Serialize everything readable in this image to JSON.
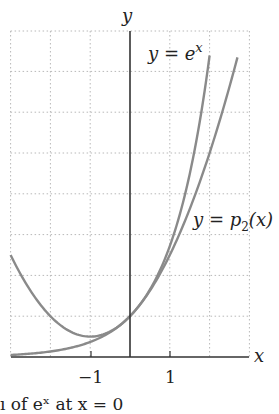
{
  "chart_data": {
    "type": "line",
    "title": "",
    "xlabel": "x",
    "ylabel": "y",
    "xlim": [
      -3,
      3
    ],
    "ylim": [
      0,
      8
    ],
    "grid": true,
    "x_ticks": [
      -1,
      1
    ],
    "x_tick_labels": [
      "−1",
      "1"
    ],
    "series": [
      {
        "name": "y = e^x",
        "label_parts": {
          "base": "y = e",
          "sup": "x"
        },
        "function": "exp(x)",
        "domain": [
          -3,
          2.0
        ],
        "x": [
          -3,
          -2,
          -1,
          0,
          1,
          1.5,
          2.0
        ],
        "values": [
          0.05,
          0.14,
          0.37,
          1.0,
          2.72,
          4.48,
          7.39
        ]
      },
      {
        "name": "y = p2(x)",
        "label_parts": {
          "base": "y = p",
          "sub": "2",
          "tail": "(x)"
        },
        "function": "1 + x + x^2/2",
        "domain": [
          -3,
          2.7
        ],
        "x": [
          -3,
          -2,
          -1,
          0,
          1,
          2,
          2.7
        ],
        "values": [
          2.5,
          1.0,
          0.5,
          1.0,
          2.5,
          5.0,
          7.35
        ]
      }
    ],
    "colors": {
      "curves": "#8a8a8a",
      "axes": "#333333",
      "grid": "#b5b5b5"
    }
  },
  "labels": {
    "y_axis": "y",
    "x_axis": "x",
    "ex_label": "y = e",
    "ex_sup": "x",
    "p2_label": "y = p",
    "p2_sub": "2",
    "p2_tail": "(x)",
    "tick_neg1": "−1",
    "tick_pos1": "1"
  },
  "caption": "ı of eˣ at x = 0"
}
